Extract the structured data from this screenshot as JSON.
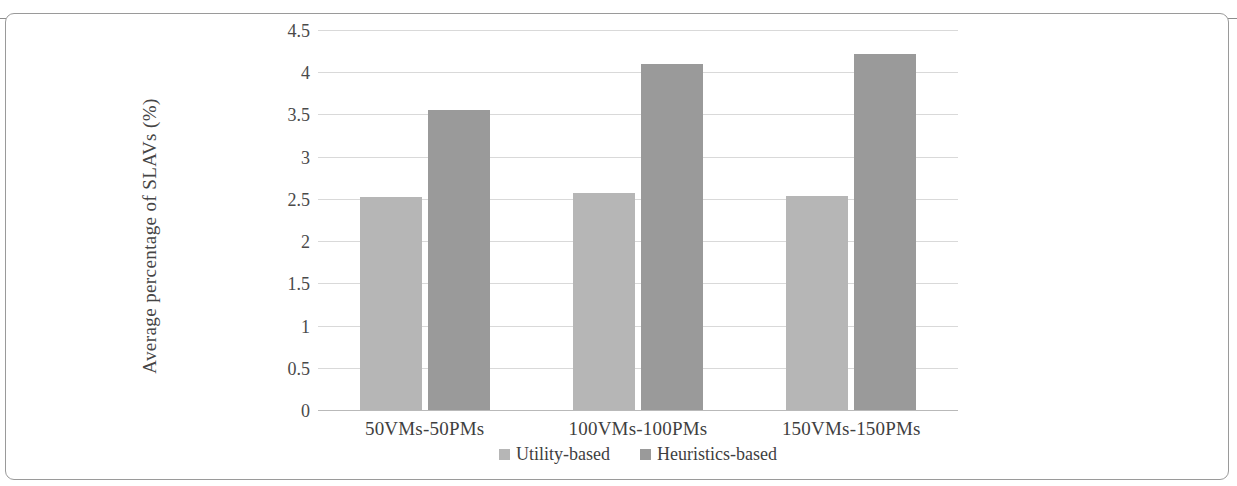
{
  "chart_data": {
    "type": "bar",
    "title": "",
    "xlabel": "",
    "ylabel": "Average percentage of SLAVs (%)",
    "categories": [
      "50VMs-50PMs",
      "100VMs-100PMs",
      "150VMs-150PMs"
    ],
    "series": [
      {
        "name": "Utility-based",
        "color": "#b6b6b6",
        "values": [
          2.52,
          2.57,
          2.54
        ]
      },
      {
        "name": "Heuristics-based",
        "color": "#9a9a9a",
        "values": [
          3.55,
          4.1,
          4.22
        ]
      }
    ],
    "ylim": [
      0,
      4.5
    ],
    "ytick_labels": [
      "4.5",
      "4",
      "3.5",
      "3",
      "2.5",
      "2",
      "1.5",
      "1",
      "0.5",
      "0"
    ],
    "ytick_values": [
      4.5,
      4,
      3.5,
      3,
      2.5,
      2,
      1.5,
      1,
      0.5,
      0
    ],
    "grid": true,
    "legend_position": "bottom-center"
  }
}
